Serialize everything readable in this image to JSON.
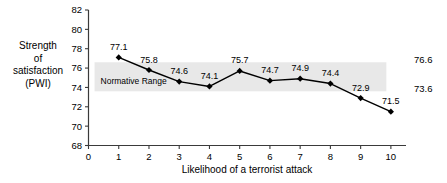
{
  "chart_data": {
    "type": "line",
    "title": "",
    "xlabel": "Likelihood of a terrorist attack",
    "ylabel": "Strength of satisfaction (PWI)",
    "ylabel_lines": [
      "Strength",
      "of",
      "satisfaction",
      "(PWI)"
    ],
    "x": [
      1,
      2,
      3,
      4,
      5,
      6,
      7,
      8,
      9,
      10
    ],
    "values": [
      77.1,
      75.8,
      74.6,
      74.1,
      75.7,
      74.7,
      74.9,
      74.4,
      72.9,
      71.5
    ],
    "point_labels": [
      "77.1",
      "75.8",
      "74.6",
      "74.1",
      "75.7",
      "74.7",
      "74.9",
      "74.4",
      "72.9",
      "71.5"
    ],
    "xlim": [
      0,
      10.5
    ],
    "ylim": [
      68,
      82
    ],
    "xticks": [
      0,
      1,
      2,
      3,
      4,
      5,
      6,
      7,
      8,
      9,
      10
    ],
    "xtick_labels": [
      "0",
      "1",
      "2",
      "3",
      "4",
      "5",
      "6",
      "7",
      "8",
      "9",
      "10"
    ],
    "yticks": [
      68,
      70,
      72,
      74,
      76,
      78,
      80,
      82
    ],
    "ytick_labels": [
      "68",
      "70",
      "72",
      "74",
      "76",
      "78",
      "80",
      "82"
    ],
    "grid": false,
    "legend": false,
    "marker": "diamond",
    "line_color": "#000000",
    "band": {
      "label": "Normative Range",
      "upper": 76.6,
      "lower": 73.6,
      "upper_label": "76.6",
      "lower_label": "73.6",
      "color": "#e8e8e8"
    }
  }
}
